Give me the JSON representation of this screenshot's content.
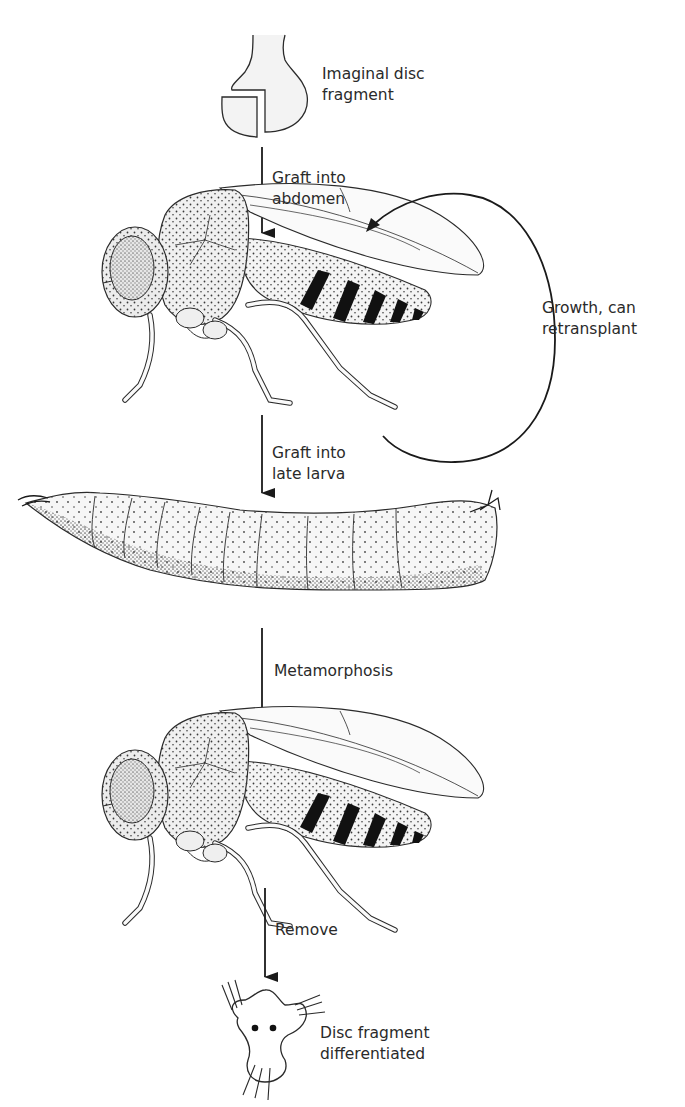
{
  "diagram": {
    "steps": [
      {
        "id": "disc",
        "label_line1": "Imaginal disc",
        "label_line2": "fragment"
      },
      {
        "id": "arrow1",
        "label_line1": "Graft into",
        "label_line2": "abdomen"
      },
      {
        "id": "adult1",
        "label": "Adult fly host"
      },
      {
        "id": "loop",
        "label_line1": "Growth, can",
        "label_line2": "retransplant"
      },
      {
        "id": "arrow2",
        "label_line1": "Graft into",
        "label_line2": "late larva"
      },
      {
        "id": "larva",
        "label": "Late larva host"
      },
      {
        "id": "arrow3",
        "label_line1": "Metamorphosis"
      },
      {
        "id": "adult2",
        "label": "Adult fly after metamorphosis"
      },
      {
        "id": "arrow4",
        "label_line1": "Remove"
      },
      {
        "id": "result",
        "label_line1": "Disc fragment",
        "label_line2": "differentiated"
      }
    ],
    "colors": {
      "line": "#2a2a2a",
      "fill_light": "#f2f2f2",
      "stipple": "#3a3a3a",
      "band": "#111111"
    }
  }
}
